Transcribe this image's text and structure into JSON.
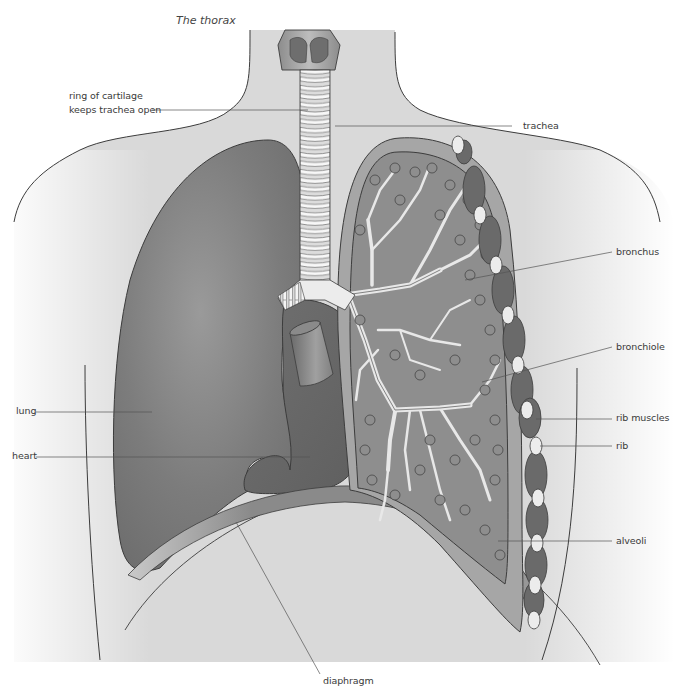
{
  "title": "The thorax",
  "labels": {
    "ring_of_cartilage_line1": "ring of cartilage",
    "ring_of_cartilage_line2": "keeps trachea open",
    "trachea": "trachea",
    "bronchus": "bronchus",
    "bronchiole": "bronchiole",
    "lung": "lung",
    "rib_muscles": "rib muscles",
    "heart": "heart",
    "rib": "rib",
    "alveoli": "alveoli",
    "diaphragm": "diaphragm"
  },
  "colors": {
    "body_fill": "#d9d9d9",
    "lung_fill": "#7a7a7a",
    "lung_cut_outer": "#999999",
    "lung_cut_inner": "#8c8c8c",
    "heart_fill": "#6f6f6f",
    "cartilage": "#f2f2f2",
    "rib": "#ececec",
    "rib_muscle": "#6a6a6a",
    "diaphragm": "#9a9a9a",
    "outline": "#3c3c3c",
    "leader_line": "#555555"
  }
}
